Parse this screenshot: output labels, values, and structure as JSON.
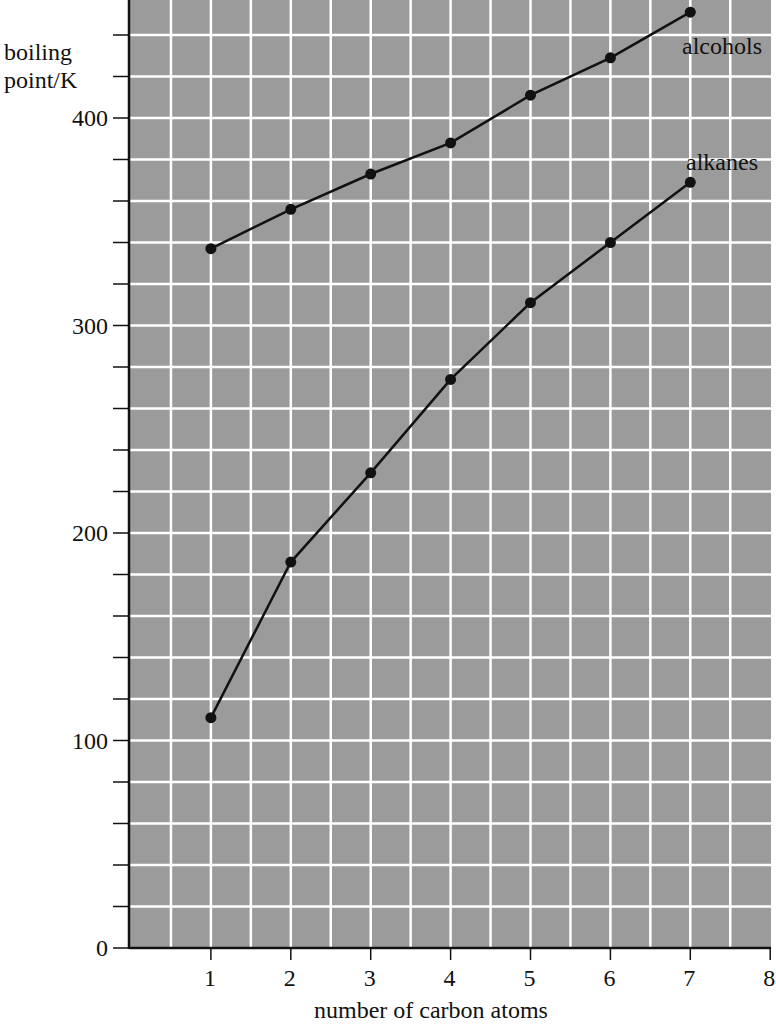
{
  "chart_data": {
    "type": "line",
    "title": "",
    "xlabel": "number of carbon atoms",
    "ylabel": "boiling point/K",
    "ylabel_lines": [
      "boiling",
      "point/K"
    ],
    "x": [
      1,
      2,
      3,
      4,
      5,
      6,
      7
    ],
    "xticks": [
      1,
      2,
      3,
      4,
      5,
      6,
      7,
      8
    ],
    "yticks": [
      0,
      100,
      200,
      300,
      400
    ],
    "xlim": [
      0,
      8
    ],
    "ylim": [
      0,
      455
    ],
    "grid": true,
    "grid_spacing": {
      "x": 0.5,
      "y": 20
    },
    "series": [
      {
        "name": "alcohols",
        "values": [
          337,
          356,
          373,
          388,
          411,
          429,
          451
        ]
      },
      {
        "name": "alkanes",
        "values": [
          111,
          186,
          229,
          274,
          311,
          340,
          369
        ]
      }
    ],
    "colors": {
      "plot_background": "#9b9b9b",
      "grid": "#ffffff",
      "line": "#111111",
      "axis": "#111111"
    }
  }
}
